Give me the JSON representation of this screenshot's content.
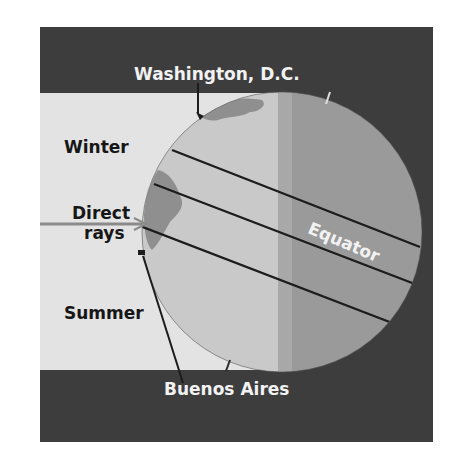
{
  "diagram": {
    "labels": {
      "washington": "Washington, D.C.",
      "winter": "Winter",
      "direct_line1": "Direct",
      "direct_line2": "rays",
      "summer": "Summer",
      "equator": "Equator",
      "buenos_aires": "Buenos Aires"
    },
    "colors": {
      "frame_dark": "#3d3d3d",
      "light_panel": "#e3e3e3",
      "globe_day": "#c9c9c9",
      "globe_night": "#9a9a9a",
      "shadow_band": "#a8a8a8",
      "land": "#8f8f8f",
      "latitude_lines": "#1c1c1c",
      "ray": "#8a8a8a",
      "label_dark": "#161616",
      "label_light": "#f2f2f2"
    }
  }
}
